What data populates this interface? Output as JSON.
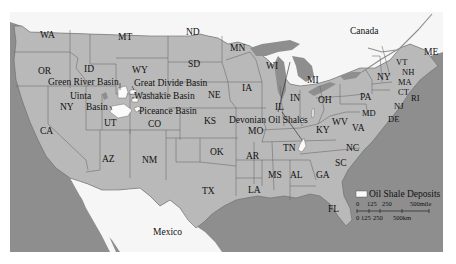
{
  "map": {
    "title": "Oil Shale Deposits in the United States",
    "countries": {
      "canada": "Canada",
      "mexico": "Mexico"
    },
    "states": {
      "WA": "WA",
      "OR": "OR",
      "CA": "CA",
      "ID": "ID",
      "NV": "NY",
      "MT": "MT",
      "WY": "WY",
      "UT": "UT",
      "CO": "CO",
      "AZ": "AZ",
      "NM": "NM",
      "ND": "ND",
      "SD": "SD",
      "NE": "NE",
      "KS": "KS",
      "OK": "OK",
      "TX": "TX",
      "MN": "MN",
      "IA": "IA",
      "MO": "MO",
      "AR": "AR",
      "LA": "LA",
      "WI": "WI",
      "IL": "IL",
      "MI": "MI",
      "IN": "IN",
      "OH": "OH",
      "KY": "KY",
      "TN": "TN",
      "MS": "MS",
      "AL": "AL",
      "GA": "GA",
      "FL": "FL",
      "SC": "SC",
      "NC": "NC",
      "VA": "VA",
      "WV": "WV",
      "PA": "PA",
      "NY": "NY",
      "VT": "VT",
      "NH": "NH",
      "ME": "ME",
      "MA": "MA",
      "CT": "CT",
      "RI": "RI",
      "NJ": "NJ",
      "DE": "DE",
      "MD": "MD"
    },
    "basins": {
      "green_river": "Green River Basin",
      "great_divide": "Great Divide Basin",
      "uinta_1": "Uinta",
      "uinta_2": "Basin",
      "washakie": "Washakie Basin",
      "piceance": "Piceance Basin",
      "devonian": "Devonian Oil Shales"
    },
    "colors": {
      "water": "#8e8e8e",
      "us_land": "#b9b9b9",
      "foreign_land": "#f6f6f6",
      "deposit": "#fafafa",
      "border": "#666666"
    }
  },
  "legend": {
    "label": "Oil Shale Deposits",
    "scale_mile_ticks": [
      "0",
      "125",
      "250",
      "500mile"
    ],
    "scale_km_ticks": [
      "0",
      "125",
      "250",
      "500km"
    ]
  }
}
